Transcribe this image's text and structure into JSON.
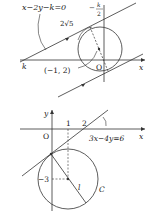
{
  "figure1": {
    "line_label": "x−2y−k=0",
    "k_top_label": "k",
    "k_top_den": "2",
    "k_top_minus": "−",
    "distance_label": "2√5",
    "center_label": "(−1, 2)",
    "k_axis_label": "k",
    "origin_label": "O",
    "x_axis_label": "x"
  },
  "figure2": {
    "y_axis_label": "y",
    "x_axis_label": "x",
    "origin_label": "O",
    "tick_1": "1",
    "tick_2": "2",
    "line_label": "3x−4y=6",
    "tick_neg3": "−3",
    "radius_label": "l",
    "circle_label": "C"
  },
  "colors": {
    "stroke": "#333333",
    "background": "#ffffff"
  }
}
